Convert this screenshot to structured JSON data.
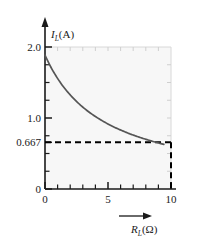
{
  "chart_data": {
    "type": "line",
    "title": "",
    "subtitle": "",
    "xlabel": "R_L (Ω)",
    "ylabel": "I_L (A)",
    "xlabel_symbol": "R",
    "xlabel_subscript": "L",
    "xlabel_unit": "(Ω)",
    "ylabel_symbol": "I",
    "ylabel_subscript": "L",
    "ylabel_unit": "(A)",
    "xlim": [
      0,
      10.6
    ],
    "ylim": [
      0,
      2.12
    ],
    "xticks": [
      0,
      1,
      2,
      3,
      4,
      5,
      6,
      7,
      8,
      9,
      10
    ],
    "xtick_labels": [
      "0",
      "",
      "",
      "",
      "",
      "5",
      "",
      "",
      "",
      "",
      "10"
    ],
    "yticks": [
      0,
      0.667,
      1.0,
      2.0
    ],
    "ytick_labels": [
      "0",
      "0.667",
      "1.0",
      "2.0"
    ],
    "yminor_ticks": [
      0.25,
      0.5,
      0.75,
      1.25,
      1.5,
      1.75
    ],
    "grid": false,
    "legend": null,
    "curve_expression": "I_L = 10 / (R_L + 5)",
    "series": [
      {
        "name": "I_L vs R_L",
        "color": "#555555",
        "x": [
          0,
          0.5,
          1,
          1.5,
          2,
          2.5,
          3,
          3.5,
          4,
          4.5,
          5,
          5.5,
          6,
          6.5,
          7,
          7.5,
          8,
          8.5,
          9,
          9.5,
          10
        ],
        "values": [
          2.0,
          1.818,
          1.667,
          1.538,
          1.429,
          1.333,
          1.25,
          1.176,
          1.111,
          1.053,
          1.0,
          0.952,
          0.909,
          0.87,
          0.833,
          0.8,
          0.769,
          0.741,
          0.714,
          0.69,
          0.667
        ]
      }
    ],
    "annotations": [
      {
        "name": "horizontal-asymptote-line",
        "type": "dashed-horizontal-line",
        "y": 0.667,
        "x_from": 0,
        "x_to": 10,
        "color": "#000000"
      },
      {
        "name": "vertical-dropline",
        "type": "dashed-vertical-line",
        "x": 10,
        "y_from": 0,
        "y_to": 0.667,
        "color": "#000000"
      }
    ],
    "axis_arrows": {
      "y_axis_arrow": "up",
      "x_axis_label_arrow": "right"
    }
  }
}
